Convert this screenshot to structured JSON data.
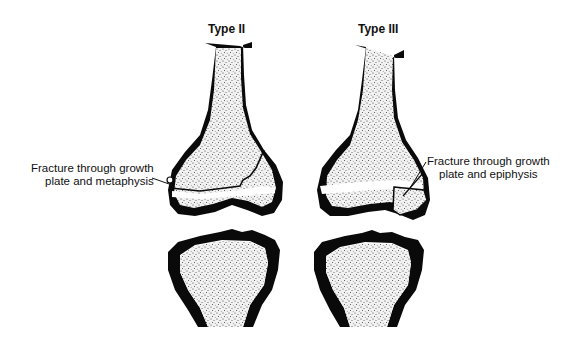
{
  "diagram": {
    "panels": [
      {
        "title": "Type II",
        "annotation": {
          "line1": "Fracture through growth",
          "line2": "plate and metaphysis"
        }
      },
      {
        "title": "Type III",
        "annotation": {
          "line1": "Fracture through growth",
          "line2": "plate and epiphysis"
        }
      }
    ],
    "colors": {
      "cortex": "#0a0a0a",
      "marrow": "#eeeeee",
      "background": "#ffffff"
    }
  }
}
